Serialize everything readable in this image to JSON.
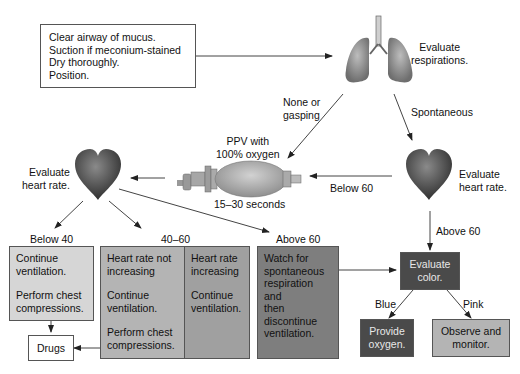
{
  "initial_steps": {
    "lines": [
      "Clear airway of mucus.",
      "Suction if meconium-stained",
      "Dry thoroughly.",
      "Position."
    ]
  },
  "lungs": {
    "icon": "lungs-icon",
    "label_line1": "Evaluate",
    "label_line2": "respirations."
  },
  "branches": {
    "none_or_gasping_line1": "None or",
    "none_or_gasping_line2": "gasping",
    "spontaneous": "Spontaneous",
    "below_60": "Below 60",
    "above_60_right": "Above 60",
    "below_40": "Below 40",
    "range_40_60": "40–60",
    "above_60_left": "Above 60",
    "blue": "Blue",
    "pink": "Pink"
  },
  "ppv": {
    "icon": "bag-valve-mask-icon",
    "label_line1": "PPV with",
    "label_line2": "100% oxygen",
    "duration": "15–30 seconds"
  },
  "heart_left": {
    "icon": "heart-icon",
    "label_line1": "Evaluate",
    "label_line2": "heart rate."
  },
  "heart_right": {
    "icon": "heart-icon",
    "label_line1": "Evaluate",
    "label_line2": "heart rate."
  },
  "box_below40": {
    "line1": "Continue",
    "line2": "ventilation.",
    "line3": "Perform chest",
    "line4": "compressions."
  },
  "box_not_increasing": {
    "line1": "Heart rate not",
    "line2": "increasing",
    "line3": "Continue",
    "line4": "ventilation.",
    "line5": "Perform chest",
    "line6": "compressions."
  },
  "box_increasing": {
    "line1": "Heart rate",
    "line2": "increasing",
    "line3": "Continue",
    "line4": "ventilation."
  },
  "box_above60": {
    "line1": "Watch for",
    "line2": "spontaneous",
    "line3": "respiration and",
    "line4": "then",
    "line5": "discontinue",
    "line6": "ventilation."
  },
  "drugs": {
    "label": "Drugs"
  },
  "evaluate_color": {
    "line1": "Evaluate",
    "line2": "color."
  },
  "provide_oxygen": {
    "line1": "Provide",
    "line2": "oxygen."
  },
  "observe_monitor": {
    "line1": "Observe and",
    "line2": "monitor."
  },
  "colors": {
    "light_box": "#d6d6d6",
    "mid_box": "#b4b4b4",
    "mid_dark_box": "#a0a0a0",
    "dark_box": "#7e7e7e",
    "darkest_box": "#4a4a4a",
    "line": "#333333"
  }
}
